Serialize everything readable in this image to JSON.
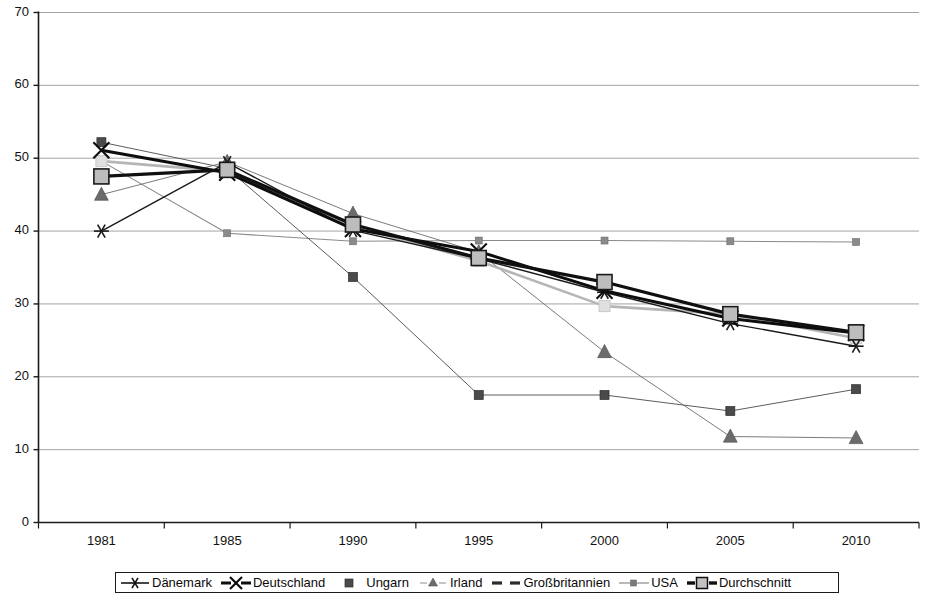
{
  "chart_data": {
    "type": "line",
    "title": "",
    "subtitle": "",
    "xlabel": "",
    "ylabel": "",
    "categories": [
      "1981",
      "1985",
      "1990",
      "1995",
      "2000",
      "2005",
      "2010"
    ],
    "x_tick_labels": [
      "1981",
      "1985",
      "1990",
      "1995",
      "2000",
      "2005",
      "2010"
    ],
    "y_tick_labels": [
      "0",
      "10",
      "20",
      "30",
      "40",
      "50",
      "60",
      "70"
    ],
    "y_ticks": [
      0,
      10,
      20,
      30,
      40,
      50,
      60,
      70
    ],
    "ylim": [
      0,
      70
    ],
    "grid": "horizontal",
    "legend_position": "bottom",
    "series": [
      {
        "name": "Dänemark",
        "marker": "asterisk",
        "color": "#1a1a1a",
        "line_width": 1.4,
        "values": [
          40.0,
          49.4,
          40.1,
          36.2,
          31.6,
          27.3,
          24.2
        ]
      },
      {
        "name": "Deutschland",
        "marker": "cross-x",
        "color": "#0d0d0d",
        "line_width": 3.0,
        "values": [
          51.1,
          48.0,
          40.3,
          37.2,
          31.8,
          28.0,
          26.0
        ]
      },
      {
        "name": "Ungarn",
        "marker": "square-small",
        "color": "#4a4a4a",
        "line_width": 0.9,
        "values": [
          52.2,
          48.6,
          33.7,
          17.5,
          17.5,
          15.3,
          18.3
        ]
      },
      {
        "name": "Irland",
        "marker": "triangle",
        "color": "#6b6b6b",
        "line_width": 0.9,
        "values": [
          45.0,
          49.5,
          42.4,
          37.1,
          23.4,
          11.8,
          11.6
        ]
      },
      {
        "name": "Großbritannien",
        "marker": "square-light",
        "color": "#b5b5b5",
        "line_width": 2.6,
        "values": [
          49.6,
          48.2,
          40.7,
          35.9,
          29.7,
          28.6,
          25.3
        ]
      },
      {
        "name": "USA",
        "marker": "square-tiny",
        "color": "#8a8a8a",
        "line_width": 1.1,
        "values": [
          49.6,
          39.7,
          38.6,
          38.7,
          38.7,
          38.6,
          38.5
        ]
      },
      {
        "name": "Durchschnitt",
        "marker": "square-large",
        "color": "#101010",
        "line_width": 3.2,
        "values": [
          47.5,
          48.4,
          40.9,
          36.3,
          33.0,
          28.6,
          26.1
        ]
      }
    ]
  },
  "legend": {
    "entries": [
      {
        "label": "Dänemark",
        "key": "dashed-asterisk"
      },
      {
        "label": "Deutschland",
        "key": "thick-cross"
      },
      {
        "label": "Ungarn",
        "key": "square-dark"
      },
      {
        "label": "Irland",
        "key": "dashed-triangle"
      },
      {
        "label": "Großbritannien",
        "key": "dashed-thick-light"
      },
      {
        "label": "USA",
        "key": "line-tiny-square"
      },
      {
        "label": "Durchschnitt",
        "key": "thick-square-light"
      }
    ]
  },
  "axes": {
    "y_labels": [
      "70",
      "60",
      "50",
      "40",
      "30",
      "20",
      "10",
      "0"
    ],
    "x_labels": [
      "1981",
      "1985",
      "1990",
      "1995",
      "2000",
      "2005",
      "2010"
    ]
  },
  "colors": {
    "axis": "#1a1a1a",
    "grid": "#9a9a9a",
    "background": "#ffffff"
  }
}
